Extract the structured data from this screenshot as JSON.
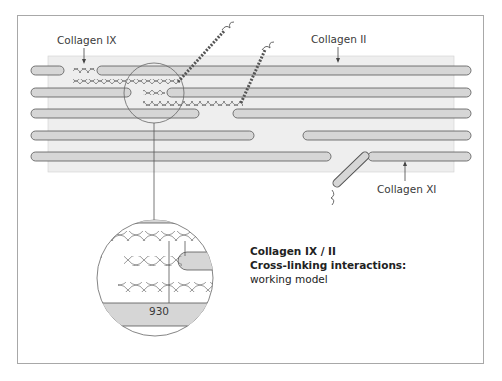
{
  "figure": {
    "labels": {
      "collagen_ix": "Collagen IX",
      "collagen_ii": "Collagen II",
      "collagen_xi": "Collagen XI",
      "residue": "930"
    },
    "caption": {
      "line1": "Collagen IX / II",
      "line2": "Cross-linking interactions:",
      "line3": "working model"
    },
    "colors": {
      "background_panel": "#eeeeee",
      "fibril_fill": "#d6d6d6",
      "outline": "#555555",
      "frame": "#a8a8a8"
    }
  }
}
